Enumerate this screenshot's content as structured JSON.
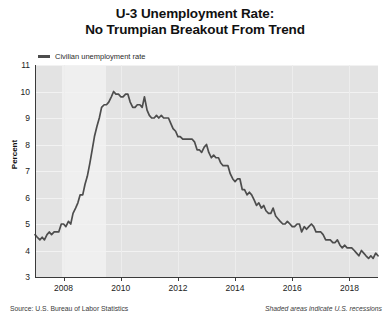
{
  "title": {
    "line1": "U-3 Unemployment Rate:",
    "line2": "No Trumpian Breakout From Trend"
  },
  "legend": {
    "label": "Civilian unemployment rate",
    "color": "#4d4d4d"
  },
  "footer": {
    "source": "Source: U.S. Bureau of Labor Statistics",
    "note": "Shaded areas indicate U.S. recessions"
  },
  "chart_data": {
    "type": "line",
    "title": "U-3 Unemployment Rate: No Trumpian Breakout From Trend",
    "xlabel": "",
    "ylabel": "Percent",
    "ylim": [
      3,
      11
    ],
    "xlim": [
      2007.0,
      2019.0
    ],
    "yticks": [
      3,
      4,
      5,
      6,
      7,
      8,
      9,
      10,
      11
    ],
    "xticks": [
      2008,
      2010,
      2012,
      2014,
      2016,
      2018
    ],
    "grid": true,
    "legend_position": "top-left",
    "line_color": "#4d4d4d",
    "plot_background": "#e3e3e3",
    "recession_color": "#efefef",
    "recession_bands": [
      {
        "start": 2007.95,
        "end": 2009.5,
        "label": "Great Recession"
      }
    ],
    "series": [
      {
        "name": "Civilian unemployment rate",
        "x": [
          2007.0,
          2007.08,
          2007.17,
          2007.25,
          2007.33,
          2007.42,
          2007.5,
          2007.58,
          2007.67,
          2007.75,
          2007.83,
          2007.92,
          2008.0,
          2008.08,
          2008.17,
          2008.25,
          2008.33,
          2008.42,
          2008.5,
          2008.58,
          2008.67,
          2008.75,
          2008.83,
          2008.92,
          2009.0,
          2009.08,
          2009.17,
          2009.25,
          2009.33,
          2009.42,
          2009.5,
          2009.58,
          2009.67,
          2009.75,
          2009.83,
          2009.92,
          2010.0,
          2010.08,
          2010.17,
          2010.25,
          2010.33,
          2010.42,
          2010.5,
          2010.58,
          2010.67,
          2010.75,
          2010.83,
          2010.92,
          2011.0,
          2011.08,
          2011.17,
          2011.25,
          2011.33,
          2011.42,
          2011.5,
          2011.58,
          2011.67,
          2011.75,
          2011.83,
          2011.92,
          2012.0,
          2012.08,
          2012.17,
          2012.25,
          2012.33,
          2012.42,
          2012.5,
          2012.58,
          2012.67,
          2012.75,
          2012.83,
          2012.92,
          2013.0,
          2013.08,
          2013.17,
          2013.25,
          2013.33,
          2013.42,
          2013.5,
          2013.58,
          2013.67,
          2013.75,
          2013.83,
          2013.92,
          2014.0,
          2014.08,
          2014.17,
          2014.25,
          2014.33,
          2014.42,
          2014.5,
          2014.58,
          2014.67,
          2014.75,
          2014.83,
          2014.92,
          2015.0,
          2015.08,
          2015.17,
          2015.25,
          2015.33,
          2015.42,
          2015.5,
          2015.58,
          2015.67,
          2015.75,
          2015.83,
          2015.92,
          2016.0,
          2016.08,
          2016.17,
          2016.25,
          2016.33,
          2016.42,
          2016.5,
          2016.58,
          2016.67,
          2016.75,
          2016.83,
          2016.92,
          2017.0,
          2017.08,
          2017.17,
          2017.25,
          2017.33,
          2017.42,
          2017.5,
          2017.58,
          2017.67,
          2017.75,
          2017.83,
          2017.92,
          2018.0,
          2018.08,
          2018.17,
          2018.25,
          2018.33,
          2018.42,
          2018.5,
          2018.58,
          2018.67,
          2018.75,
          2018.83,
          2018.92,
          2019.0
        ],
        "values": [
          4.6,
          4.5,
          4.4,
          4.5,
          4.4,
          4.6,
          4.7,
          4.6,
          4.7,
          4.7,
          4.7,
          5.0,
          5.0,
          4.9,
          5.1,
          5.0,
          5.4,
          5.6,
          5.8,
          6.1,
          6.1,
          6.5,
          6.8,
          7.3,
          7.8,
          8.3,
          8.7,
          9.0,
          9.4,
          9.5,
          9.5,
          9.6,
          9.8,
          10.0,
          9.9,
          9.9,
          9.8,
          9.8,
          9.9,
          9.9,
          9.6,
          9.4,
          9.4,
          9.5,
          9.5,
          9.4,
          9.8,
          9.3,
          9.1,
          9.0,
          9.0,
          9.1,
          9.0,
          9.1,
          9.0,
          9.0,
          9.0,
          8.8,
          8.6,
          8.5,
          8.3,
          8.3,
          8.2,
          8.2,
          8.2,
          8.2,
          8.2,
          8.1,
          7.8,
          7.8,
          7.7,
          7.9,
          8.0,
          7.7,
          7.5,
          7.6,
          7.5,
          7.5,
          7.3,
          7.2,
          7.2,
          7.2,
          6.9,
          6.7,
          6.6,
          6.7,
          6.7,
          6.3,
          6.3,
          6.1,
          6.2,
          6.1,
          5.9,
          5.7,
          5.8,
          5.6,
          5.7,
          5.5,
          5.4,
          5.4,
          5.6,
          5.3,
          5.2,
          5.1,
          5.0,
          5.0,
          5.1,
          5.0,
          4.9,
          4.9,
          5.0,
          5.0,
          4.7,
          4.9,
          4.8,
          4.9,
          5.0,
          4.9,
          4.7,
          4.7,
          4.7,
          4.6,
          4.4,
          4.4,
          4.4,
          4.3,
          4.3,
          4.4,
          4.2,
          4.1,
          4.2,
          4.1,
          4.1,
          4.1,
          4.0,
          3.9,
          3.8,
          4.0,
          3.9,
          3.8,
          3.7,
          3.8,
          3.7,
          3.9,
          3.8
        ]
      }
    ]
  }
}
